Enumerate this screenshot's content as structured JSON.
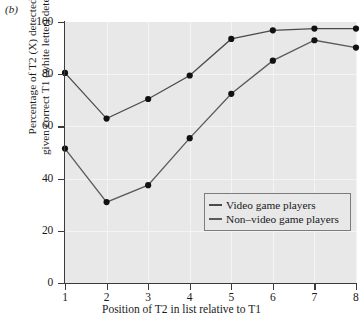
{
  "panel": {
    "label": "(b)"
  },
  "colors": {
    "plot_background": "#e8e8e8",
    "axis": "#3b3b3b",
    "grid": "#f4f4f4",
    "series_vgp": "#4a4a4a",
    "series_nvgp": "#5a5a5a",
    "marker": "#111111",
    "legend_border": "#7c7c7c"
  },
  "legend": {
    "position": "inside-lower-right",
    "entries": [
      {
        "name": "legend-entry-vgp",
        "label": "Video game players",
        "color": "#4a4a4a"
      },
      {
        "name": "legend-entry-nvgp",
        "label": "Non–video game players",
        "color": "#5a5a5a"
      }
    ]
  },
  "axes": {
    "y_ticks": [
      "0",
      "20",
      "40",
      "60",
      "80",
      "100"
    ],
    "x_ticks": [
      "1",
      "2",
      "3",
      "4",
      "5",
      "6",
      "7",
      "8"
    ],
    "ylabel_line1": "Percentage of T2 (X) detected,",
    "ylabel_line2": "given correct T1 (white letter) detection",
    "xlabel": "Position of T2 in list relative to T1"
  },
  "chart_data": {
    "type": "line",
    "title": "",
    "subtitle": "",
    "panel_label": "(b)",
    "xlabel": "Position of T2 in list relative to T1",
    "ylabel": "Percentage of T2 (X) detected, given correct T1 (white letter) detection",
    "x": [
      1,
      2,
      3,
      4,
      5,
      6,
      7,
      8
    ],
    "xlim": [
      0.7,
      8.15
    ],
    "ylim": [
      0,
      100
    ],
    "xticks": [
      1,
      2,
      3,
      4,
      5,
      6,
      7,
      8
    ],
    "yticks": [
      0,
      20,
      40,
      60,
      80,
      100
    ],
    "grid": true,
    "legend_position": "lower right (inside axes)",
    "markers": "filled circle",
    "series": [
      {
        "name": "Video game players",
        "values": [
          80.5,
          63.0,
          70.5,
          79.5,
          93.5,
          96.8,
          97.5,
          97.5
        ]
      },
      {
        "name": "Non–video game players",
        "values": [
          51.5,
          31.0,
          37.5,
          55.5,
          72.5,
          85.2,
          93.0,
          90.2
        ]
      }
    ]
  }
}
